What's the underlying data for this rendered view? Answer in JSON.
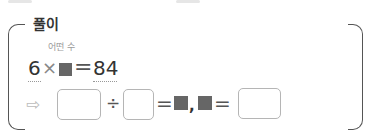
{
  "section": {
    "title": "풀이"
  },
  "equation": {
    "hint_label": "어떤 수",
    "multiplicand": "6",
    "times_symbol": "×",
    "unknown_symbol": "■",
    "equals_symbol": "=",
    "product": "84"
  },
  "solution_row": {
    "arrow_symbol": "⇨",
    "divide_symbol": "÷",
    "equals_symbol": "=",
    "comma": ",",
    "answer_boxes": [
      {
        "value": "",
        "placeholder": ""
      },
      {
        "value": "",
        "placeholder": ""
      },
      {
        "value": "",
        "placeholder": ""
      }
    ]
  },
  "colors": {
    "text": "#333333",
    "hint": "#9a9a9a",
    "square": "#666666",
    "box_border": "#b5b5b5"
  }
}
